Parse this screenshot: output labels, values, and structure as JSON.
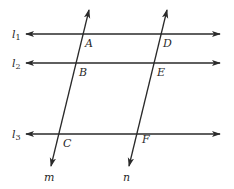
{
  "diagram": {
    "type": "parallel-lines-transversals",
    "stroke_color": "#2a2a2a",
    "background": "#ffffff",
    "horizontal_lines": [
      {
        "id": "l1",
        "label": "l",
        "subscript": "1",
        "y": 34,
        "x_left": 26,
        "x_right": 220
      },
      {
        "id": "l2",
        "label": "l",
        "subscript": "2",
        "y": 63,
        "x_left": 26,
        "x_right": 220
      },
      {
        "id": "l3",
        "label": "l",
        "subscript": "3",
        "y": 134,
        "x_left": 26,
        "x_right": 220
      }
    ],
    "transversals": [
      {
        "id": "m",
        "label": "m",
        "x_top": 89,
        "y_top": 10,
        "x_bottom": 51,
        "y_bottom": 166
      },
      {
        "id": "n",
        "label": "n",
        "x_top": 167,
        "y_top": 10,
        "x_bottom": 129,
        "y_bottom": 166
      }
    ],
    "points": [
      {
        "label": "A",
        "x": 85,
        "y": 47
      },
      {
        "label": "B",
        "x": 79,
        "y": 76
      },
      {
        "label": "C",
        "x": 63,
        "y": 147
      },
      {
        "label": "D",
        "x": 163,
        "y": 47
      },
      {
        "label": "E",
        "x": 157,
        "y": 76
      },
      {
        "label": "F",
        "x": 142,
        "y": 143
      }
    ],
    "line_labels": [
      {
        "text": "l",
        "sub": "1",
        "x": 12,
        "y": 38
      },
      {
        "text": "l",
        "sub": "2",
        "x": 12,
        "y": 67
      },
      {
        "text": "l",
        "sub": "3",
        "x": 12,
        "y": 138
      },
      {
        "text": "m",
        "x": 44,
        "y": 181
      },
      {
        "text": "n",
        "x": 123,
        "y": 181
      }
    ]
  }
}
